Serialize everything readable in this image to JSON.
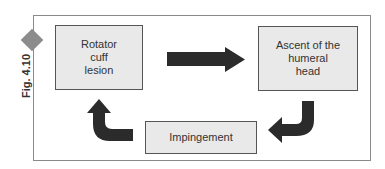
{
  "figure": {
    "label": "Fig. 4.10",
    "accent_color": "#8c8c8c",
    "arrow_color": "#2b2b2b",
    "box_fill": "#e9e9e9"
  },
  "nodes": [
    {
      "id": "rotator-cuff-lesion",
      "label": "Rotator\ncuff\nlesion"
    },
    {
      "id": "ascent-humeral-head",
      "label": "Ascent of the\nhumeral\nhead"
    },
    {
      "id": "impingement",
      "label": "Impingement"
    }
  ],
  "edges": [
    {
      "from": "rotator-cuff-lesion",
      "to": "ascent-humeral-head",
      "shape": "straight-arrow"
    },
    {
      "from": "ascent-humeral-head",
      "to": "impingement",
      "shape": "curved-arrow"
    },
    {
      "from": "impingement",
      "to": "rotator-cuff-lesion",
      "shape": "curved-arrow"
    }
  ]
}
